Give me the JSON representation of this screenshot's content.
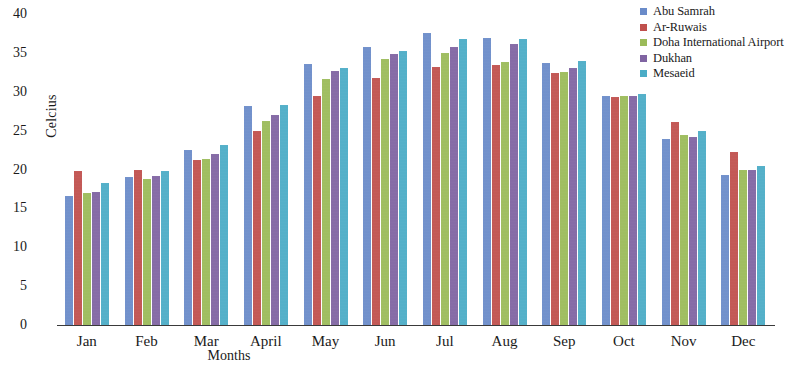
{
  "chart_data": {
    "type": "bar",
    "title": "",
    "xlabel": "Months",
    "ylabel": "Celcius",
    "ylim": [
      0,
      40
    ],
    "yticks": [
      0,
      5,
      10,
      15,
      20,
      25,
      30,
      35,
      40
    ],
    "grid": false,
    "legend_position": "top-right",
    "categories": [
      "Jan",
      "Feb",
      "Mar",
      "April",
      "May",
      "Jun",
      "Jul",
      "Aug",
      "Sep",
      "Oct",
      "Nov",
      "Dec"
    ],
    "series": [
      {
        "name": "Abu Samrah",
        "color": "#6A8BC9",
        "values": [
          16.6,
          19.0,
          22.5,
          28.2,
          33.6,
          35.8,
          37.5,
          36.9,
          33.7,
          29.4,
          23.9,
          19.3
        ]
      },
      {
        "name": "Ar-Ruwais",
        "color": "#C0504D",
        "values": [
          19.8,
          19.9,
          21.2,
          24.9,
          29.4,
          31.8,
          33.2,
          33.5,
          32.4,
          29.3,
          26.1,
          22.2
        ]
      },
      {
        "name": "Doha International Airport",
        "color": "#9BBB59",
        "values": [
          17.0,
          18.8,
          21.3,
          26.2,
          31.7,
          34.2,
          35.0,
          33.8,
          32.6,
          29.5,
          24.5,
          20.0
        ]
      },
      {
        "name": "Dukhan",
        "color": "#8064A2",
        "values": [
          17.1,
          19.2,
          22.0,
          27.0,
          32.7,
          34.8,
          35.8,
          36.2,
          33.1,
          29.4,
          24.2,
          19.9
        ]
      },
      {
        "name": "Mesaeid",
        "color": "#4BACC6",
        "values": [
          18.3,
          19.8,
          23.2,
          28.3,
          33.1,
          35.2,
          36.8,
          36.8,
          33.9,
          29.7,
          24.9,
          20.5
        ]
      }
    ]
  },
  "legend": {
    "items": [
      {
        "label": "Abu Samrah",
        "color": "#6A8BC9"
      },
      {
        "label": "Ar-Ruwais",
        "color": "#C0504D"
      },
      {
        "label": "Doha International Airport",
        "color": "#9BBB59"
      },
      {
        "label": "Dukhan",
        "color": "#8064A2"
      },
      {
        "label": "Mesaeid",
        "color": "#4BACC6"
      }
    ]
  }
}
